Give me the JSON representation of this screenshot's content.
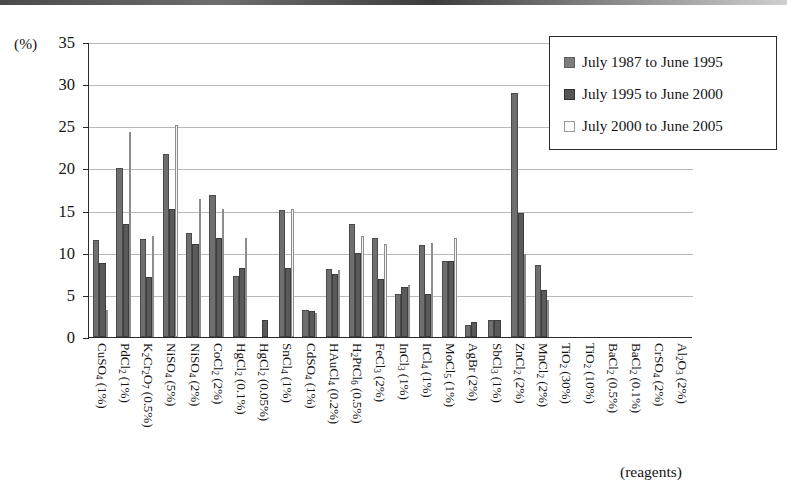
{
  "chart_data": {
    "type": "bar",
    "title": "",
    "xlabel": "(reagents)",
    "ylabel": "(%)",
    "ylim": [
      0,
      35
    ],
    "yticks": [
      0,
      5,
      10,
      15,
      20,
      25,
      30,
      35
    ],
    "grid": true,
    "legend_position": "top-right",
    "categories": [
      "CuSO4 (1%)",
      "PdCl2 (1%)",
      "K2Cr2O7 (0.5%)",
      "NiSO4 (5%)",
      "NiSO4 (2%)",
      "CoCl2 (2%)",
      "HgCl2 (0.1%)",
      "HgCl2 (0.05%)",
      "SnCl4 (1%)",
      "CdSO4 (1%)",
      "HAuCl4 (0.2%)",
      "H2PtCl6 (0.5%)",
      "FeCl3 (2%)",
      "InCl3 (1%)",
      "IrCl4 (1%)",
      "MoCl5 (1%)",
      "AgBr (2%)",
      "SbCl3 (1%)",
      "ZnCl2 (2%)",
      "MnCl2 (2%)",
      "TiO2 (30%)",
      "TiO2 (10%)",
      "BaCl2 (0.5%)",
      "BaCl2 (0.1%)",
      "CrSO4 (2%)",
      "Al2O3 (2%)"
    ],
    "categories_html": [
      "CuSO<sub>4</sub> (1%)",
      "PdCl<sub>2</sub> (1%)",
      "K<sub>2</sub>Cr<sub>2</sub>O<sub>7</sub> (0.5%)",
      "NiSO<sub>4</sub> (5%)",
      "NiSO<sub>4</sub> (2%)",
      "CoCl<sub>2</sub> (2%)",
      "HgCl<sub>2</sub> (0.1%)",
      "HgCl<sub>2</sub> (0.05%)",
      "SnCl<sub>4</sub> (1%)",
      "CdSO<sub>4</sub> (1%)",
      "HAuCl<sub>4</sub> (0.2%)",
      "H<sub>2</sub>PtCl<sub>6</sub> (0.5%)",
      "FeCl<sub>3</sub> (2%)",
      "InCl<sub>3</sub> (1%)",
      "IrCl<sub>4</sub> (1%)",
      "MoCl<sub>5</sub> (1%)",
      "AgBr (2%)",
      "SbCl<sub>3</sub> (1%)",
      "ZnCl<sub>2</sub> (2%)",
      "MnCl<sub>2</sub> (2%)",
      "TiO<sub>2</sub> (30%)",
      "TiO<sub>2</sub> (10%)",
      "BaCl<sub>2</sub> (0.5%)",
      "BaCl<sub>2</sub> (0.1%)",
      "CrSO<sub>4</sub> (2%)",
      "Al<sub>2</sub>O<sub>3</sub> (2%)"
    ],
    "series": [
      {
        "name": "July 1987 to June 1995",
        "color": "#6f6f6f",
        "values": [
          11.5,
          20.0,
          11.6,
          21.7,
          12.4,
          16.9,
          7.2,
          0.0,
          15.1,
          3.2,
          8.1,
          13.4,
          11.7,
          5.1,
          10.9,
          9.0,
          1.4,
          2.0,
          29.0,
          8.5,
          0.0,
          0.0,
          0.0,
          0.0,
          0.0,
          0.0
        ]
      },
      {
        "name": "July 1995 to June 2000",
        "color": "#5a5a5a",
        "values": [
          8.8,
          13.4,
          7.1,
          15.2,
          11.0,
          11.7,
          8.2,
          2.0,
          8.2,
          3.1,
          7.5,
          10.0,
          6.9,
          5.9,
          5.1,
          9.0,
          1.8,
          2.0,
          14.7,
          5.6,
          0.0,
          0.0,
          0.0,
          0.0,
          0.0,
          0.0
        ]
      },
      {
        "name": "July 2000 to June 2005",
        "color": "#f3f3f3",
        "values": [
          3.2,
          24.3,
          12.0,
          25.1,
          16.4,
          15.2,
          11.8,
          0.0,
          15.2,
          2.8,
          8.0,
          12.0,
          11.0,
          6.2,
          11.2,
          11.8,
          0.0,
          0.0,
          9.8,
          4.4,
          0.0,
          0.0,
          0.0,
          0.0,
          0.0,
          0.0
        ]
      }
    ]
  },
  "legend": {
    "items": [
      {
        "label": "July 1987 to June 1995",
        "swatch": "series-1-swatch"
      },
      {
        "label": "July 1995 to June 2000",
        "swatch": "series-2-swatch"
      },
      {
        "label": "July 2000 to June 2005",
        "swatch": "series-3-swatch"
      }
    ]
  },
  "axes": {
    "y_unit": "(%)",
    "x_caption": "(reagents)"
  }
}
